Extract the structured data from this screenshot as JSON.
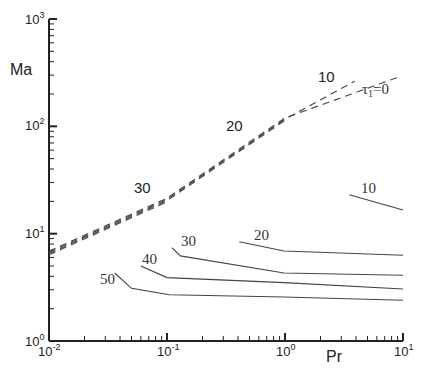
{
  "chart_data": {
    "type": "line",
    "title": "",
    "xlabel": "Pr",
    "ylabel": "Ma",
    "xscale": "log",
    "yscale": "log",
    "xlim": [
      0.01,
      10
    ],
    "ylim": [
      1,
      1000
    ],
    "grid": false,
    "legend": "none (inline curve labels)",
    "x_tick_labels": [
      {
        "base": "10",
        "exp": "-2",
        "value": 0.01
      },
      {
        "base": "10",
        "exp": "-1",
        "value": 0.1
      },
      {
        "base": "10",
        "exp": "0",
        "value": 1
      },
      {
        "base": "10",
        "exp": "1",
        "value": 10
      }
    ],
    "y_tick_labels": [
      {
        "base": "10",
        "exp": "0",
        "value": 1
      },
      {
        "base": "10",
        "exp": "1",
        "value": 10
      },
      {
        "base": "10",
        "exp": "2",
        "value": 100
      },
      {
        "base": "10",
        "exp": "3",
        "value": 1000
      }
    ],
    "series": [
      {
        "name": "τ1=0 (dashed)",
        "style": "dashed",
        "label": "τ1=0",
        "x": [
          0.01,
          0.1,
          1,
          9.2
        ],
        "y": [
          6.6,
          20.6,
          115,
          277
        ]
      },
      {
        "name": "10 (dashed)",
        "style": "dashed",
        "label": "10",
        "x": [
          0.01,
          0.1,
          1,
          3.9
        ],
        "y": [
          6.6,
          20.6,
          115,
          260
        ]
      },
      {
        "name": "20 (dashed)",
        "style": "dashed",
        "label": "20",
        "x": [
          0.01,
          0.1,
          1
        ],
        "y": [
          6.6,
          20.6,
          115
        ]
      },
      {
        "name": "30 (dashed)",
        "style": "dashed",
        "label": "30",
        "x": [
          0.01,
          0.1
        ],
        "y": [
          6.6,
          20.6
        ]
      },
      {
        "name": "10 (solid)",
        "style": "solid",
        "label": "10",
        "x": [
          3.5,
          10
        ],
        "y": [
          23,
          16.6
        ]
      },
      {
        "name": "20 (solid)",
        "style": "solid",
        "label": "20",
        "x": [
          0.41,
          0.98,
          10
        ],
        "y": [
          8.4,
          6.9,
          6.3
        ]
      },
      {
        "name": "30 (solid)",
        "style": "solid",
        "label": "30",
        "x": [
          0.11,
          0.13,
          0.98,
          10
        ],
        "y": [
          7.4,
          6.2,
          4.3,
          4.1
        ]
      },
      {
        "name": "40 (solid)",
        "style": "solid",
        "label": "40",
        "x": [
          0.06,
          0.1,
          0.98,
          10
        ],
        "y": [
          5.0,
          3.9,
          3.5,
          3.05
        ]
      },
      {
        "name": "50 (solid)",
        "style": "solid",
        "label": "50",
        "x": [
          0.036,
          0.05,
          0.105,
          0.98,
          10
        ],
        "y": [
          4.3,
          3.1,
          2.7,
          2.57,
          2.4
        ]
      }
    ]
  },
  "labels": {
    "xlabel": "Pr",
    "ylabel": "Ma",
    "tau_base": "τ",
    "tau_sub": "1",
    "tau_eq": "=0",
    "dashed_10": "10",
    "dashed_20": "20",
    "dashed_30": "30",
    "solid_10": "10",
    "solid_20": "20",
    "solid_30": "30",
    "solid_40": "40",
    "solid_50": "50",
    "ytick_base": "10",
    "ytick_exp": [
      "0",
      "1",
      "2",
      "3"
    ],
    "xtick_base": "10",
    "xtick_exp": [
      "-2",
      "-1",
      "0",
      "1"
    ]
  },
  "colors": {
    "axis": "#222222",
    "curve": "#444444",
    "text": "#222222"
  }
}
